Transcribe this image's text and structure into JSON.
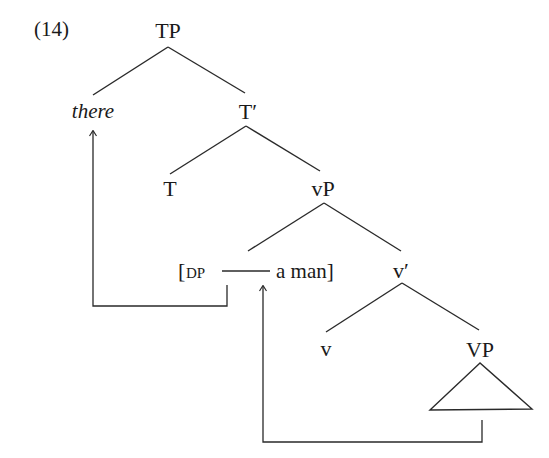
{
  "example": {
    "number": "(14)"
  },
  "tree": {
    "nodes": {
      "tp": "TP",
      "there": "there",
      "t_bar": "T′",
      "t": "T",
      "vp_little": "vP",
      "dp_open": "[",
      "dp_label": "DP",
      "dp_content": "a man]",
      "v_bar": "v′",
      "v": "v",
      "vp_big": "VP"
    },
    "edges": [
      [
        "TP",
        "there"
      ],
      [
        "TP",
        "T′"
      ],
      [
        "T′",
        "T"
      ],
      [
        "T′",
        "vP"
      ],
      [
        "vP",
        "DP"
      ],
      [
        "vP",
        "v′"
      ],
      [
        "v′",
        "v"
      ],
      [
        "v′",
        "VP"
      ]
    ],
    "triangle_under": "VP",
    "movement_arrows": [
      {
        "from": "DP gap (specifier position)",
        "to": "there"
      },
      {
        "from": "VP",
        "to": "DP gap"
      }
    ]
  }
}
